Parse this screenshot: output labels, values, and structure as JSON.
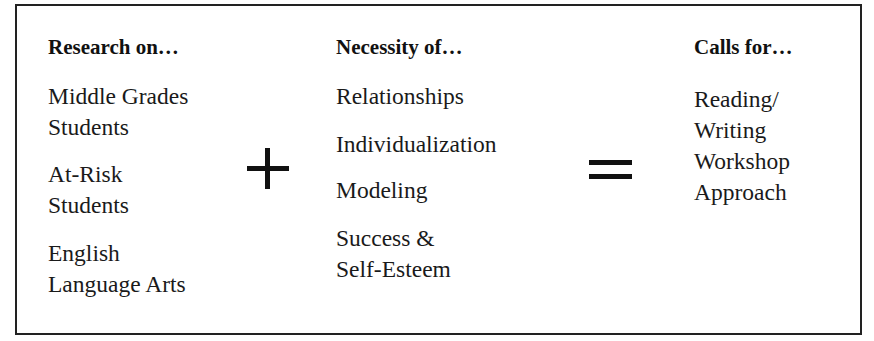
{
  "diagram": {
    "columns": [
      {
        "heading": "Research on…",
        "items": [
          [
            "Middle Grades",
            "Students"
          ],
          [
            "At-Risk",
            "Students"
          ],
          [
            "English",
            "Language Arts"
          ]
        ]
      },
      {
        "heading": "Necessity of…",
        "items": [
          [
            "Relationships"
          ],
          [
            "Individualization"
          ],
          [
            "Modeling"
          ],
          [
            "Success &",
            "Self-Esteem"
          ]
        ]
      },
      {
        "heading": "Calls for…",
        "items": [
          [
            "Reading/",
            "Writing",
            "Workshop",
            "Approach"
          ]
        ]
      }
    ],
    "operators": [
      {
        "symbol": "+",
        "name": "plus"
      },
      {
        "symbol": "=",
        "name": "equals"
      }
    ],
    "colors": {
      "border": "#222222",
      "text": "#1a1a1a",
      "background": "#ffffff"
    }
  }
}
